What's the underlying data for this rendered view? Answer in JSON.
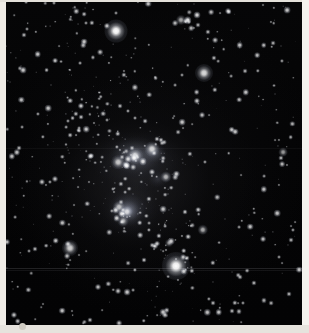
{
  "image": {
    "title": "Orion Constellation Star Field",
    "subject": "Orion",
    "type": "astronomical photograph",
    "medium": "black and white photographic plate",
    "width_px": 309,
    "height_px": 333,
    "background_color": "#030303",
    "plate_border_color": "#efece6",
    "star_color": "#ffffff",
    "nebula_color": "#9aa0b4"
  },
  "artifacts": {
    "scanline": {
      "label": "horizontal scan line",
      "y": 267,
      "color": "#2a2a2c"
    },
    "corner_dot": {
      "label": "emulsion blemish",
      "color": "#cfcbc2"
    }
  },
  "named_stars": [
    {
      "name": "Betelgeuse",
      "x": 116,
      "y": 31,
      "r": 11.5,
      "core": 4.2,
      "brightness": 1.0
    },
    {
      "name": "Bellatrix",
      "x": 204,
      "y": 73,
      "r": 9.0,
      "core": 3.4,
      "brightness": 0.86
    },
    {
      "name": "Rigel",
      "x": 176,
      "y": 266,
      "r": 14.0,
      "core": 5.0,
      "brightness": 1.0
    },
    {
      "name": "Saiph",
      "x": 70,
      "y": 248,
      "r": 8.0,
      "core": 3.2,
      "brightness": 0.82
    },
    {
      "name": "Alnitak",
      "x": 152,
      "y": 149,
      "r": 7.5,
      "core": 3.0,
      "brightness": 0.8
    },
    {
      "name": "Alnilam",
      "x": 135,
      "y": 156,
      "r": 8.0,
      "core": 3.2,
      "brightness": 0.84
    },
    {
      "name": "Mintaka",
      "x": 118,
      "y": 162,
      "r": 6.8,
      "core": 2.7,
      "brightness": 0.76
    },
    {
      "name": "Eta Orionis",
      "x": 119,
      "y": 207,
      "r": 6.0,
      "core": 2.5,
      "brightness": 0.7
    },
    {
      "name": "Theta Orionis",
      "x": 127,
      "y": 212,
      "r": 6.2,
      "core": 2.6,
      "brightness": 0.72
    },
    {
      "name": "Iota Orionis",
      "x": 123,
      "y": 221,
      "r": 5.4,
      "core": 2.2,
      "brightness": 0.66
    },
    {
      "name": "Sigma Orionis",
      "x": 166,
      "y": 177,
      "r": 5.6,
      "core": 2.3,
      "brightness": 0.68
    },
    {
      "name": "Meissa",
      "x": 181,
      "y": 20,
      "r": 5.0,
      "core": 2.1,
      "brightness": 0.64
    },
    {
      "name": "Tabit",
      "x": 203,
      "y": 230,
      "r": 5.2,
      "core": 2.2,
      "brightness": 0.66
    },
    {
      "name": "Pi3 Orionis",
      "x": 283,
      "y": 152,
      "r": 4.4,
      "core": 1.9,
      "brightness": 0.6
    },
    {
      "name": "Tau Orionis",
      "x": 169,
      "y": 243,
      "r": 4.0,
      "core": 1.7,
      "brightness": 0.55
    }
  ],
  "nebula_regions": [
    {
      "name": "Orion Nebula M42",
      "cx": 40,
      "cy": 64,
      "rx": 11,
      "ry": 9,
      "opacity": 0.5
    },
    {
      "name": "Belt nebulosity",
      "cx": 45,
      "cy": 48,
      "rx": 14,
      "ry": 10,
      "opacity": 0.42
    },
    {
      "name": "Flame region",
      "cx": 52,
      "cy": 46,
      "rx": 9,
      "ry": 7,
      "opacity": 0.3
    },
    {
      "name": "Sword glow",
      "cx": 41,
      "cy": 66,
      "rx": 8,
      "ry": 8,
      "opacity": 0.34
    }
  ],
  "star_clusters": [
    {
      "name": "Upper-right cluster",
      "cx": 185,
      "cy": 22,
      "count": 9
    },
    {
      "name": "Belt group",
      "cx": 135,
      "cy": 157,
      "count": 12
    },
    {
      "name": "Sword group",
      "cx": 123,
      "cy": 213,
      "count": 10
    }
  ],
  "accessibility": {
    "alt_text": "A black-and-white long-exposure astronomical photograph of the constellation Orion against a dense field of faint stars. Bright Betelgeuse glows near the top left of centre, Rigel blazes at lower right of centre, and the three belt stars run diagonally across the middle above the glowing Orion Nebula sword."
  }
}
